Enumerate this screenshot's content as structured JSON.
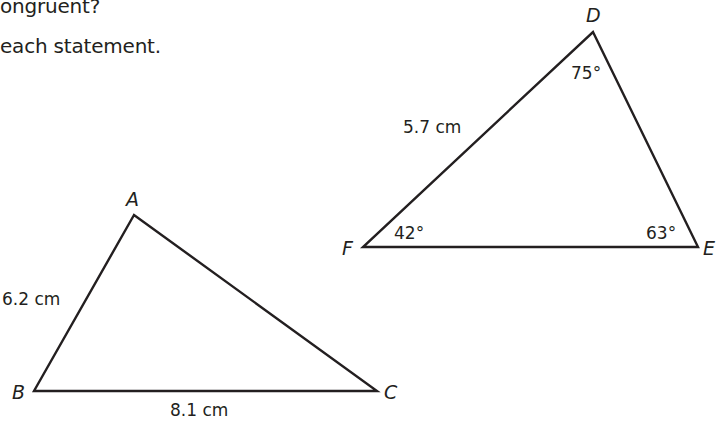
{
  "question": {
    "line1": "ongruent?",
    "line2": "each statement."
  },
  "triangle_abc": {
    "vertices": {
      "A": {
        "label": "A",
        "x": 134,
        "y": 215
      },
      "B": {
        "label": "B",
        "x": 34,
        "y": 391
      },
      "C": {
        "label": "C",
        "x": 377,
        "y": 391
      }
    },
    "side_ab": "6.2 cm",
    "side_bc": "8.1 cm"
  },
  "triangle_def": {
    "vertices": {
      "D": {
        "label": "D",
        "x": 593,
        "y": 32
      },
      "E": {
        "label": "E",
        "x": 698,
        "y": 247
      },
      "F": {
        "label": "F",
        "x": 363,
        "y": 247
      }
    },
    "side_df": "5.7 cm",
    "angle_d": "75°",
    "angle_e": "63°",
    "angle_f": "42°"
  }
}
